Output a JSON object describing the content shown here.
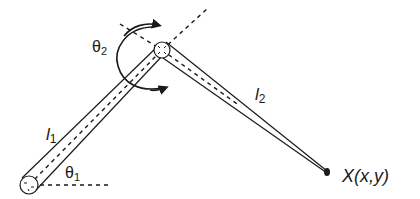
{
  "diagram": {
    "type": "two-link planar robot arm",
    "colors": {
      "stroke": "#1a1a1a",
      "background": "#ffffff"
    },
    "labels": {
      "link1": {
        "main": "l",
        "sub": "1"
      },
      "link2": {
        "main": "l",
        "sub": "2"
      },
      "theta1": {
        "main": "θ",
        "sub": "1"
      },
      "theta2": {
        "main": "θ",
        "sub": "2"
      },
      "endpoint": "X(x,y)"
    },
    "joints": [
      {
        "name": "base-joint",
        "x": 29,
        "y": 185
      },
      {
        "name": "elbow-joint",
        "x": 162,
        "y": 50
      }
    ],
    "endpoint": {
      "x": 327,
      "y": 172
    }
  }
}
